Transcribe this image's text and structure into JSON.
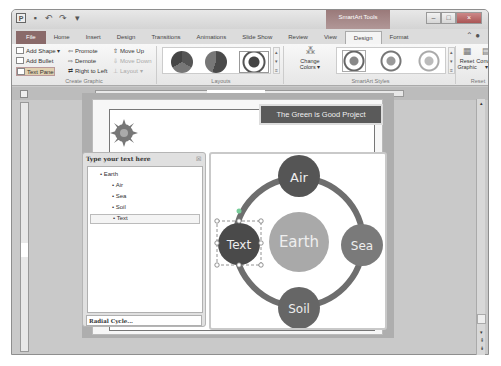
{
  "window": {
    "app_icon": "P",
    "contextual_tab_group": "SmartArt Tools",
    "controls": {
      "minimize": "‒",
      "maximize": "□",
      "close": "×"
    }
  },
  "tabs": [
    {
      "label": "File"
    },
    {
      "label": "Home"
    },
    {
      "label": "Insert"
    },
    {
      "label": "Design"
    },
    {
      "label": "Transitions"
    },
    {
      "label": "Animations"
    },
    {
      "label": "Slide Show"
    },
    {
      "label": "Review"
    },
    {
      "label": "View"
    },
    {
      "label": "Design",
      "active": true
    },
    {
      "label": "Format"
    }
  ],
  "ribbon": {
    "create_graphic": {
      "label": "Create Graphic",
      "add_shape": "Add Shape ▾",
      "add_bullet": "Add Bullet",
      "text_pane": "Text Pane",
      "promote": "Promote",
      "demote": "Demote",
      "right_to_left": "Right to Left",
      "move_up": "Move Up",
      "move_down": "Move Down",
      "layout": "Layout ▾"
    },
    "layouts": {
      "label": "Layouts"
    },
    "smartart_styles": {
      "label": "SmartArt Styles",
      "change_colors": "Change Colors ▾"
    },
    "reset": {
      "label": "Reset",
      "reset_graphic": "Reset Graphic",
      "convert": "Convert ▾"
    }
  },
  "slide": {
    "title": "The Green is Good Project"
  },
  "text_pane": {
    "header": "Type your text here",
    "close": "☒",
    "items": [
      {
        "text": "Earth",
        "level": 1
      },
      {
        "text": "Air",
        "level": 2
      },
      {
        "text": "Sea",
        "level": 2
      },
      {
        "text": "Soil",
        "level": 2
      },
      {
        "text": "Text",
        "level": 2,
        "selected": true
      }
    ],
    "footer": "Radial Cycle..."
  },
  "diagram": {
    "center": "Earth",
    "nodes": [
      "Air",
      "Sea",
      "Soil",
      "Text"
    ],
    "colors": {
      "dark": "#5a5a5a",
      "mid": "#7a7a7a",
      "center": "#a9a9a9",
      "ring": "#6e6e6e"
    }
  }
}
